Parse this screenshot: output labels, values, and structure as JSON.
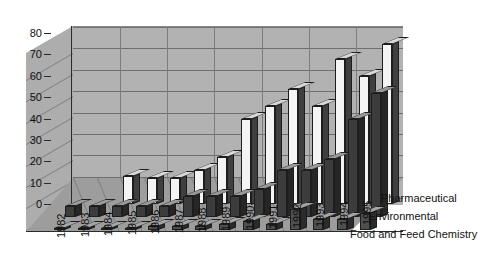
{
  "chart_data": {
    "type": "bar",
    "subtype": "3d-grouped-bar",
    "title": "",
    "subtitle": "",
    "xlabel": "",
    "ylabel": "",
    "ylim": [
      0,
      80
    ],
    "yticks": [
      0,
      10,
      20,
      30,
      40,
      50,
      60,
      70,
      80
    ],
    "ytick_labels": [
      "0",
      "10",
      "20",
      "30",
      "40",
      "50",
      "60",
      "70",
      "80"
    ],
    "grid": true,
    "legend_position": "inside-right",
    "categories": [
      "1982",
      "1983",
      "1984",
      "1985",
      "1986",
      "1987",
      "1988",
      "1989",
      "1990",
      "1991",
      "1992",
      "1993",
      "1994",
      "1995"
    ],
    "series": [
      {
        "name": "Pharmaceutical",
        "color": "#f4f4f4",
        "values": [
          0,
          0,
          13,
          12,
          12,
          16,
          22,
          40,
          46,
          54,
          46,
          68,
          60,
          75
        ]
      },
      {
        "name": "Environmental",
        "color": "#3c3c3c",
        "values": [
          5,
          5,
          5,
          5,
          5,
          10,
          10,
          10,
          13,
          22,
          22,
          27,
          46,
          58
        ]
      },
      {
        "name": "Food and Feed Chemistry",
        "color": "#4f4f4f",
        "values": [
          1,
          1,
          1,
          1,
          2,
          2,
          2,
          3,
          4,
          3,
          10,
          5,
          5,
          8
        ]
      }
    ],
    "annotations": []
  },
  "axis": {
    "y_tick_labels": [
      "80",
      "70",
      "60",
      "50",
      "40",
      "30",
      "20",
      "10",
      "0"
    ]
  },
  "series_labels": [
    "Pharmaceutical",
    "Environmental",
    "Food and Feed Chemistry"
  ]
}
